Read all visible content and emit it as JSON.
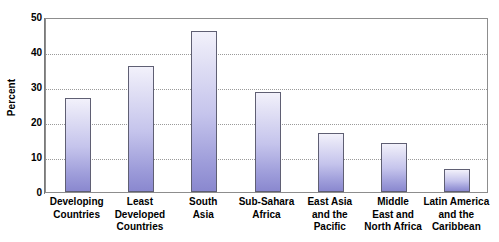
{
  "chart_data": {
    "type": "bar",
    "title": "",
    "subtitle": "",
    "xlabel": "",
    "ylabel": "Percent",
    "ylim": [
      0,
      50
    ],
    "yticks": [
      0,
      10,
      20,
      30,
      40,
      50
    ],
    "ytick_labels": [
      "0",
      "10",
      "20",
      "30",
      "40",
      "50"
    ],
    "grid": "horizontal-dotted",
    "legend": "none",
    "categories": [
      "Developing\nCountries",
      "Least\nDeveloped\nCountries",
      "South\nAsia",
      "Sub-Sahara\nAfrica",
      "East Asia\nand the\nPacific",
      "Middle\nEast and\nNorth Africa",
      "Latin America\nand the\nCaribbean"
    ],
    "values": [
      27,
      36,
      46,
      28.5,
      17,
      14,
      6.5
    ],
    "bar_color": "#9e9dda",
    "bar_border_color": "#5f5f73",
    "frame_color": "#8d8d8d",
    "gridline_color": "#9a9a9a"
  }
}
